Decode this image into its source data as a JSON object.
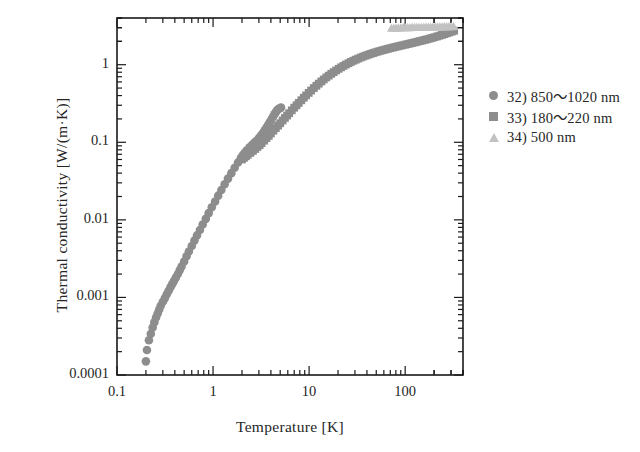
{
  "chart_data": {
    "type": "scatter",
    "title": "",
    "xlabel": "Temperature [K]",
    "ylabel": "Thermal conductivity [W/(m·K)]",
    "xscale": "log",
    "yscale": "log",
    "xlim": [
      0.1,
      400
    ],
    "ylim": [
      0.0001,
      4
    ],
    "grid": false,
    "legend_position": "right",
    "xticks": [
      0.1,
      1,
      10,
      100
    ],
    "xtick_labels": [
      "0.1",
      "1",
      "10",
      "100"
    ],
    "yticks": [
      0.0001,
      0.001,
      0.01,
      0.1,
      1
    ],
    "ytick_labels": [
      "0.0001",
      "0.001",
      "0.01",
      "0.1",
      "1"
    ],
    "series": [
      {
        "name": "32) 850～1020 nm",
        "marker": "circle",
        "color": "#8d8d8d",
        "points": [
          [
            0.2,
            0.00015
          ],
          [
            0.205,
            0.00021
          ],
          [
            0.215,
            0.00028
          ],
          [
            0.225,
            0.00034
          ],
          [
            0.235,
            0.00041
          ],
          [
            0.245,
            0.00048
          ],
          [
            0.255,
            0.00055
          ],
          [
            0.265,
            0.00062
          ],
          [
            0.275,
            0.0007
          ],
          [
            0.285,
            0.00078
          ],
          [
            0.3,
            0.00088
          ],
          [
            0.315,
            0.00098
          ],
          [
            0.33,
            0.0011
          ],
          [
            0.345,
            0.00122
          ],
          [
            0.36,
            0.00135
          ],
          [
            0.375,
            0.00148
          ],
          [
            0.39,
            0.00162
          ],
          [
            0.41,
            0.0018
          ],
          [
            0.43,
            0.002
          ],
          [
            0.45,
            0.00225
          ],
          [
            0.47,
            0.0025
          ],
          [
            0.5,
            0.0029
          ],
          [
            0.53,
            0.0034
          ],
          [
            0.56,
            0.0039
          ],
          [
            0.6,
            0.0046
          ],
          [
            0.64,
            0.0054
          ],
          [
            0.68,
            0.0063
          ],
          [
            0.73,
            0.0074
          ],
          [
            0.78,
            0.0087
          ],
          [
            0.84,
            0.0103
          ],
          [
            0.9,
            0.0122
          ],
          [
            0.97,
            0.0145
          ],
          [
            1.05,
            0.0172
          ],
          [
            1.13,
            0.0205
          ],
          [
            1.22,
            0.0243
          ],
          [
            1.32,
            0.0288
          ],
          [
            1.43,
            0.034
          ],
          [
            1.55,
            0.04
          ],
          [
            1.68,
            0.047
          ],
          [
            1.82,
            0.055
          ],
          [
            1.95,
            0.063
          ],
          [
            2.05,
            0.069
          ],
          [
            2.15,
            0.074
          ],
          [
            2.25,
            0.079
          ],
          [
            2.4,
            0.086
          ],
          [
            2.55,
            0.093
          ],
          [
            2.7,
            0.0995
          ],
          [
            2.85,
            0.105
          ],
          [
            3.0,
            0.113
          ],
          [
            3.15,
            0.122
          ],
          [
            3.3,
            0.132
          ],
          [
            3.45,
            0.143
          ],
          [
            3.6,
            0.155
          ],
          [
            3.75,
            0.168
          ],
          [
            3.9,
            0.182
          ],
          [
            4.05,
            0.197
          ],
          [
            4.2,
            0.213
          ],
          [
            4.35,
            0.229
          ],
          [
            4.5,
            0.245
          ],
          [
            4.65,
            0.258
          ],
          [
            4.8,
            0.268
          ],
          [
            4.95,
            0.275
          ],
          [
            5.1,
            0.28
          ]
        ]
      },
      {
        "name": "33) 180～220 nm",
        "marker": "square",
        "color": "#8d8d8d",
        "points": [
          [
            2.0,
            0.06
          ],
          [
            2.1,
            0.063
          ],
          [
            2.2,
            0.066
          ],
          [
            2.3,
            0.069
          ],
          [
            2.45,
            0.073
          ],
          [
            2.6,
            0.0775
          ],
          [
            2.75,
            0.082
          ],
          [
            2.9,
            0.087
          ],
          [
            3.05,
            0.092
          ],
          [
            3.2,
            0.0975
          ],
          [
            3.4,
            0.105
          ],
          [
            3.6,
            0.113
          ],
          [
            3.8,
            0.121
          ],
          [
            4.0,
            0.13
          ],
          [
            4.25,
            0.141
          ],
          [
            4.5,
            0.152
          ],
          [
            4.75,
            0.164
          ],
          [
            5.0,
            0.176
          ],
          [
            5.3,
            0.191
          ],
          [
            5.6,
            0.206
          ],
          [
            5.9,
            0.221
          ],
          [
            6.2,
            0.237
          ],
          [
            6.6,
            0.258
          ],
          [
            7.0,
            0.279
          ],
          [
            7.4,
            0.3
          ],
          [
            7.8,
            0.322
          ],
          [
            8.3,
            0.348
          ],
          [
            8.8,
            0.375
          ],
          [
            9.3,
            0.402
          ],
          [
            9.9,
            0.433
          ],
          [
            10.5,
            0.465
          ],
          [
            11.2,
            0.5
          ],
          [
            11.9,
            0.535
          ],
          [
            12.6,
            0.57
          ],
          [
            13.4,
            0.608
          ],
          [
            14.2,
            0.645
          ],
          [
            15.1,
            0.685
          ],
          [
            16.0,
            0.723
          ],
          [
            17.0,
            0.763
          ],
          [
            18.0,
            0.802
          ],
          [
            19.1,
            0.843
          ],
          [
            20.3,
            0.885
          ],
          [
            21.5,
            0.925
          ],
          [
            22.8,
            0.965
          ],
          [
            24.2,
            1.005
          ],
          [
            25.7,
            1.045
          ],
          [
            27.2,
            1.085
          ],
          [
            28.9,
            1.125
          ],
          [
            30.6,
            1.162
          ],
          [
            32.5,
            1.2
          ],
          [
            34.5,
            1.238
          ],
          [
            36.6,
            1.275
          ],
          [
            38.8,
            1.31
          ],
          [
            41.2,
            1.345
          ],
          [
            43.7,
            1.38
          ],
          [
            46.3,
            1.412
          ],
          [
            49.1,
            1.445
          ],
          [
            52.1,
            1.478
          ],
          [
            55.3,
            1.51
          ],
          [
            58.6,
            1.54
          ],
          [
            62.2,
            1.572
          ],
          [
            66.0,
            1.602
          ],
          [
            70.0,
            1.632
          ],
          [
            74.2,
            1.662
          ],
          [
            78.7,
            1.692
          ],
          [
            83.5,
            1.722
          ],
          [
            88.6,
            1.752
          ],
          [
            94.0,
            1.782
          ],
          [
            99.7,
            1.812
          ],
          [
            105.7,
            1.843
          ],
          [
            112.1,
            1.875
          ],
          [
            118.9,
            1.908
          ],
          [
            126.1,
            1.942
          ],
          [
            133.8,
            1.977
          ],
          [
            141.9,
            2.013
          ],
          [
            150.5,
            2.05
          ],
          [
            159.6,
            2.088
          ],
          [
            169.3,
            2.128
          ],
          [
            179.6,
            2.17
          ],
          [
            190.5,
            2.215
          ],
          [
            202.0,
            2.262
          ],
          [
            214.3,
            2.312
          ],
          [
            227.3,
            2.365
          ],
          [
            241.1,
            2.42
          ],
          [
            255.7,
            2.478
          ],
          [
            271.2,
            2.54
          ],
          [
            287.7,
            2.605
          ],
          [
            305.2,
            2.672
          ],
          [
            323.7,
            2.742
          ]
        ]
      },
      {
        "name": "34) 500 nm",
        "marker": "triangle",
        "color": "#c2c2c2",
        "points": [
          [
            72.0,
            2.95
          ],
          [
            76.0,
            2.96
          ],
          [
            80.5,
            2.97
          ],
          [
            85.0,
            2.98
          ],
          [
            90.0,
            2.99
          ],
          [
            95.0,
            3.0
          ],
          [
            100.5,
            3.0
          ],
          [
            106.0,
            3.01
          ],
          [
            112.0,
            3.01
          ],
          [
            118.5,
            3.02
          ],
          [
            125.0,
            3.02
          ],
          [
            132.0,
            3.03
          ],
          [
            139.5,
            3.03
          ],
          [
            147.5,
            3.04
          ],
          [
            156.0,
            3.04
          ],
          [
            165.0,
            3.05
          ],
          [
            174.0,
            3.05
          ],
          [
            184.0,
            3.06
          ],
          [
            194.5,
            3.06
          ],
          [
            205.5,
            3.07
          ],
          [
            217.0,
            3.07
          ],
          [
            229.5,
            3.08
          ],
          [
            242.5,
            3.08
          ],
          [
            256.0,
            3.09
          ],
          [
            270.5,
            3.09
          ],
          [
            286.0,
            3.1
          ],
          [
            302.0,
            3.1
          ],
          [
            319.0,
            3.11
          ]
        ]
      }
    ]
  },
  "axes": {
    "ylabel": "Thermal conductivity [W/(m·K)]",
    "xlabel": "Temperature [K]"
  },
  "legend": {
    "entries": [
      {
        "label": "32) 850～1020 nm",
        "marker": "circle-marker",
        "color": "#8d8d8d"
      },
      {
        "label": "33) 180～220 nm",
        "marker": "square-marker",
        "color": "#8d8d8d"
      },
      {
        "label": "34) 500 nm",
        "marker": "triangle-marker",
        "color": "#c2c2c2"
      }
    ]
  }
}
